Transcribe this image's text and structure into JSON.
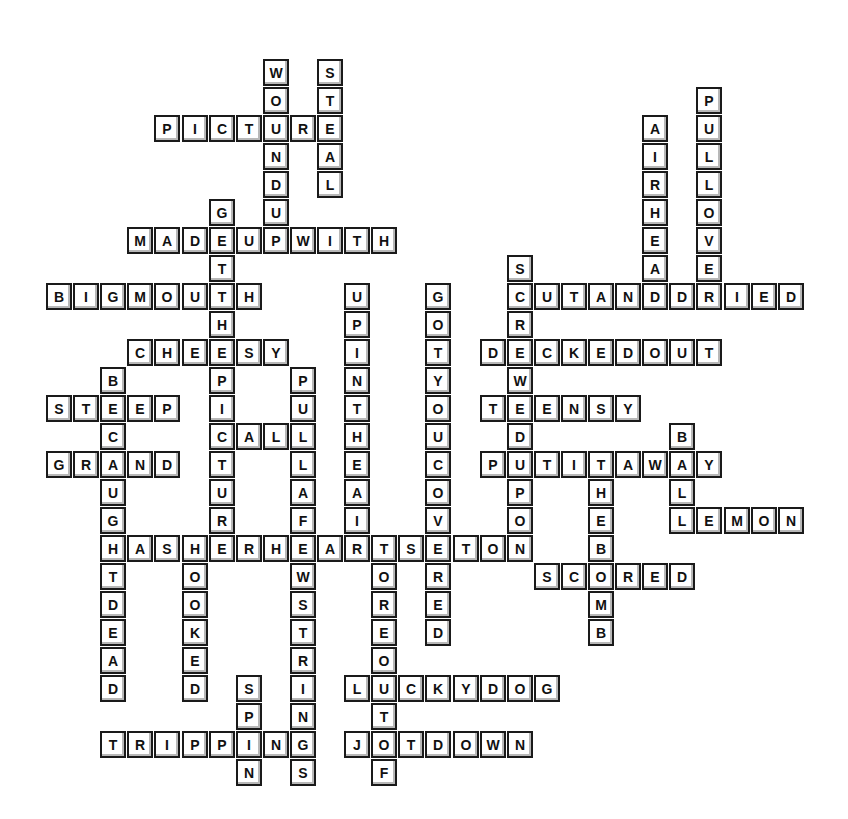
{
  "puzzle": {
    "type": "crossword",
    "grid": {
      "origin_x": 46,
      "origin_y": 59,
      "col_pitch": 27.1,
      "row_pitch": 28.0
    },
    "colors": {
      "cell_fill": "#ffffff",
      "cell_border": "#1a1a1a",
      "cell_shadow": "#b8b8b8",
      "letter": "#111111",
      "background": "#ffffff"
    },
    "words": [
      {
        "word": "WOUNDUP",
        "dir": "down",
        "row": 0,
        "col": 8
      },
      {
        "word": "STEAL",
        "dir": "down",
        "row": 0,
        "col": 10
      },
      {
        "word": "PICTURE",
        "dir": "across",
        "row": 2,
        "col": 4
      },
      {
        "word": "MADEUPWITH",
        "dir": "across",
        "row": 6,
        "col": 3
      },
      {
        "word": "GETTHEPICTURE",
        "dir": "down",
        "row": 5,
        "col": 6
      },
      {
        "word": "BIGMOUTH",
        "dir": "across",
        "row": 8,
        "col": 0
      },
      {
        "word": "CHEESY",
        "dir": "across",
        "row": 10,
        "col": 3
      },
      {
        "word": "BECAUGHTDEAD",
        "dir": "down",
        "row": 11,
        "col": 2
      },
      {
        "word": "STEEP",
        "dir": "across",
        "row": 12,
        "col": 0
      },
      {
        "word": "GRAND",
        "dir": "across",
        "row": 14,
        "col": 0
      },
      {
        "word": "CALL",
        "dir": "across",
        "row": 13,
        "col": 6
      },
      {
        "word": "PULLAFEWSTRINGS",
        "dir": "down",
        "row": 11,
        "col": 9
      },
      {
        "word": "UPINTHEAIR",
        "dir": "down",
        "row": 8,
        "col": 11
      },
      {
        "word": "GOTYOUCOVERED",
        "dir": "down",
        "row": 8,
        "col": 14
      },
      {
        "word": "HASHERHEARTSETON",
        "dir": "across",
        "row": 17,
        "col": 2
      },
      {
        "word": "TOREOUTOF",
        "dir": "down",
        "row": 17,
        "col": 12
      },
      {
        "word": "HOOKED",
        "dir": "down",
        "row": 17,
        "col": 5
      },
      {
        "word": "SPIN",
        "dir": "down",
        "row": 22,
        "col": 7
      },
      {
        "word": "TRIPPING",
        "dir": "across",
        "row": 24,
        "col": 2
      },
      {
        "word": "LUCKYDOG",
        "dir": "across",
        "row": 22,
        "col": 11
      },
      {
        "word": "JOTDOWN",
        "dir": "across",
        "row": 24,
        "col": 11
      },
      {
        "word": "SCREWEDUPON",
        "dir": "down",
        "row": 7,
        "col": 17
      },
      {
        "word": "CUTANDDRIED",
        "dir": "across",
        "row": 8,
        "col": 17
      },
      {
        "word": "AIRHEAD",
        "dir": "down",
        "row": 2,
        "col": 22
      },
      {
        "word": "PULLOVER",
        "dir": "down",
        "row": 1,
        "col": 24
      },
      {
        "word": "DECKEDOUT",
        "dir": "across",
        "row": 10,
        "col": 16
      },
      {
        "word": "TEENSY",
        "dir": "across",
        "row": 12,
        "col": 16
      },
      {
        "word": "PUTITAWAY",
        "dir": "across",
        "row": 14,
        "col": 16
      },
      {
        "word": "BALL",
        "dir": "down",
        "row": 13,
        "col": 23
      },
      {
        "word": "LEMON",
        "dir": "across",
        "row": 16,
        "col": 23
      },
      {
        "word": "THEBOMB",
        "dir": "down",
        "row": 14,
        "col": 20
      },
      {
        "word": "SCORED",
        "dir": "across",
        "row": 18,
        "col": 18
      }
    ]
  },
  "cells": []
}
